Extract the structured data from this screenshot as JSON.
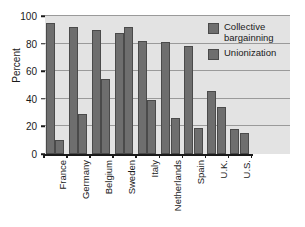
{
  "chart_data": {
    "type": "bar",
    "title": "",
    "xlabel": "",
    "ylabel": "Percent",
    "ylim": [
      0,
      100
    ],
    "yticks": [
      0,
      20,
      40,
      60,
      80,
      100
    ],
    "ytick_labels": [
      "0",
      "20",
      "40",
      "60",
      "80",
      "100"
    ],
    "grid": "horizontal",
    "legend_position": "top-right",
    "categories": [
      "France",
      "Germany",
      "Belgium",
      "Sweden",
      "Italy",
      "Netherlands",
      "Spain",
      "U.K.",
      "U.S."
    ],
    "series": [
      {
        "name": "Collective bargainning",
        "values": [
          95,
          92,
          90,
          88,
          82,
          81,
          78,
          46,
          18
        ]
      },
      {
        "name": "Unionization",
        "values": [
          10,
          29,
          54,
          92,
          39,
          26,
          19,
          34,
          15
        ]
      }
    ]
  },
  "legend": {
    "items": [
      {
        "label_line1": "Collective",
        "label_line2": "bargainning"
      },
      {
        "label_line1": "Unionization",
        "label_line2": ""
      }
    ]
  },
  "colors": {
    "bar_fill": "#6e6e6e",
    "bar_stroke": "#4a4a4a",
    "plot_background": "#e3e3e3",
    "gridline": "#9a9a9a",
    "axis": "#1a1a1a",
    "page_background": "#ffffff"
  }
}
